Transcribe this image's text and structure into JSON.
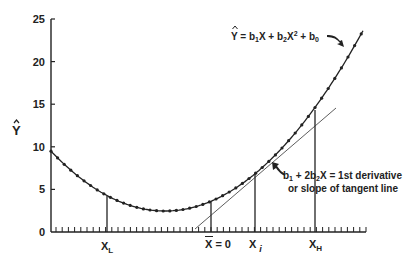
{
  "chart_data": {
    "type": "line",
    "title": "",
    "xlabel": "",
    "ylabel": "Ŷ",
    "ylim": [
      0,
      25
    ],
    "yticks": [
      0,
      5,
      10,
      15,
      20,
      25
    ],
    "grid": false,
    "legend": "none",
    "series": [
      {
        "name": "Ŷ = b1X + b2X² + b0",
        "style": "curve with dot markers",
        "description": "Quadratic (U-shaped) fitted curve",
        "points_y_approx": [
          9.6,
          8.2,
          6.9,
          5.8,
          4.6,
          3.8,
          3.1,
          2.7,
          2.5,
          2.6,
          3.0,
          3.6,
          4.6,
          5.8,
          7.2,
          8.9,
          10.8,
          13.1,
          15.5,
          18.2,
          20.9,
          23.3
        ]
      },
      {
        "name": "Tangent line",
        "style": "thin straight line",
        "description": "Tangent to the curve at X_i, crossing the x-axis left of X̄ = 0"
      }
    ],
    "vertical_markers": [
      {
        "label": "XL",
        "y_value_approx": 4.3
      },
      {
        "label": "X̄ = 0",
        "y_value_approx": 3.6
      },
      {
        "label": "Xi",
        "y_value_approx": 6.9
      },
      {
        "label": "XH",
        "y_value_approx": 14.0
      }
    ],
    "annotations": [
      {
        "text": "Ŷ = b1X + b2X² + b0",
        "points_to": "quadratic curve (upper right)"
      },
      {
        "text": "b1 + 2b2X = 1st derivative",
        "line2": "or slope of tangent line",
        "points_to": "tangent point at Xi"
      }
    ]
  },
  "labels": {
    "y_title": "Y",
    "y_ticks": [
      "0",
      "5",
      "10",
      "15",
      "20",
      "25"
    ],
    "x_low": "X",
    "x_low_sub": "L",
    "x_mean": "X = 0",
    "x_i": "X",
    "x_i_sub": "i",
    "x_high": "X",
    "x_high_sub": "H",
    "eq_main": "Y = b",
    "eq_s1": "1",
    "eq_mid": "X + b",
    "eq_s2": "2",
    "eq_x": "X",
    "eq_sup": "2",
    "eq_plus": " + b",
    "eq_s0": "0",
    "deriv_line1_a": "b",
    "deriv_line1_s1": "1",
    "deriv_line1_b": " + 2b",
    "deriv_line1_s2": "2",
    "deriv_line1_c": "X = 1st derivative",
    "deriv_line2": "or slope of tangent line"
  }
}
